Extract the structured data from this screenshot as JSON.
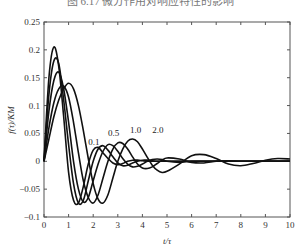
{
  "chart_data": {
    "type": "line",
    "title": "图 6.17  微分作用对响应特性的影响",
    "xlabel": "t/τ",
    "ylabel": "f(τ)/KM",
    "xlim": [
      0,
      10
    ],
    "ylim": [
      -0.1,
      0.25
    ],
    "xticks": [
      "0",
      "1",
      "2",
      "3",
      "4",
      "5",
      "6",
      "7",
      "8",
      "9",
      "10"
    ],
    "yticks": [
      "-0.1",
      "-0.05",
      "0",
      "0.05",
      "0.1",
      "0.15",
      "0.2",
      "0.25"
    ],
    "grid": false,
    "x": [
      0,
      0.2,
      0.4,
      0.6,
      0.8,
      1.0,
      1.2,
      1.4,
      1.6,
      1.8,
      2.0,
      2.2,
      2.4,
      2.6,
      2.8,
      3.0,
      3.2,
      3.4,
      3.6,
      3.8,
      4.0,
      4.2,
      4.4,
      4.6,
      4.8,
      5.0,
      5.5,
      6.0,
      6.5,
      7.0,
      7.5,
      8.0,
      8.5,
      9.0,
      9.5,
      10.0
    ],
    "series": [
      {
        "name": "",
        "label": "",
        "values": [
          0.0,
          0.15,
          0.205,
          0.17,
          0.08,
          -0.02,
          -0.07,
          -0.075,
          -0.045,
          -0.005,
          0.02,
          0.025,
          0.015,
          0.005,
          -0.003,
          -0.006,
          -0.004,
          0.0,
          0.002,
          0.002,
          0.001,
          0.0,
          0.0,
          0.0,
          0.0,
          0.0,
          0.0,
          0.0,
          0.0,
          0.0,
          0.0,
          0.0,
          0.0,
          0.0,
          0.0,
          0.0
        ]
      },
      {
        "name": "0.1",
        "label": "0.1",
        "values": [
          0.0,
          0.12,
          0.18,
          0.175,
          0.11,
          0.03,
          -0.04,
          -0.075,
          -0.07,
          -0.035,
          0.0,
          0.022,
          0.028,
          0.02,
          0.008,
          -0.003,
          -0.008,
          -0.007,
          -0.003,
          0.0,
          0.002,
          0.002,
          0.001,
          0.0,
          0.0,
          0.0,
          0.0,
          0.0,
          0.0,
          0.0,
          0.0,
          0.0,
          0.0,
          0.0,
          0.0,
          0.0
        ]
      },
      {
        "name": "0.5",
        "label": "0.5",
        "values": [
          0.0,
          0.09,
          0.145,
          0.16,
          0.13,
          0.07,
          0.0,
          -0.05,
          -0.073,
          -0.065,
          -0.035,
          -0.005,
          0.018,
          0.03,
          0.028,
          0.018,
          0.005,
          -0.005,
          -0.01,
          -0.009,
          -0.005,
          0.0,
          0.003,
          0.004,
          0.003,
          0.0,
          -0.002,
          0.0,
          0.0,
          0.0,
          0.0,
          0.0,
          0.0,
          0.0,
          0.0,
          0.0
        ]
      },
      {
        "name": "1.0",
        "label": "1.0",
        "values": [
          0.0,
          0.06,
          0.105,
          0.13,
          0.135,
          0.115,
          0.07,
          0.015,
          -0.035,
          -0.065,
          -0.075,
          -0.06,
          -0.03,
          0.0,
          0.022,
          0.033,
          0.032,
          0.022,
          0.008,
          -0.005,
          -0.012,
          -0.013,
          -0.01,
          -0.004,
          0.002,
          0.006,
          0.004,
          -0.002,
          -0.003,
          0.0,
          0.001,
          0.0,
          0.0,
          0.0,
          0.0,
          0.0
        ]
      },
      {
        "name": "2.0",
        "label": "2.0",
        "values": [
          0.0,
          0.04,
          0.08,
          0.11,
          0.13,
          0.14,
          0.13,
          0.1,
          0.055,
          0.005,
          -0.04,
          -0.068,
          -0.075,
          -0.06,
          -0.03,
          0.0,
          0.022,
          0.036,
          0.04,
          0.035,
          0.022,
          0.007,
          -0.007,
          -0.016,
          -0.02,
          -0.018,
          -0.005,
          0.01,
          0.012,
          0.005,
          -0.005,
          -0.008,
          -0.004,
          0.002,
          0.005,
          0.004
        ]
      }
    ],
    "annotations": [
      {
        "text": "0.1",
        "x": 1.8,
        "y": 0.03
      },
      {
        "text": "0.5",
        "x": 2.6,
        "y": 0.045
      },
      {
        "text": "1.0",
        "x": 3.5,
        "y": 0.05
      },
      {
        "text": "2.0",
        "x": 4.4,
        "y": 0.05
      }
    ],
    "legend": "inline curve labels"
  }
}
